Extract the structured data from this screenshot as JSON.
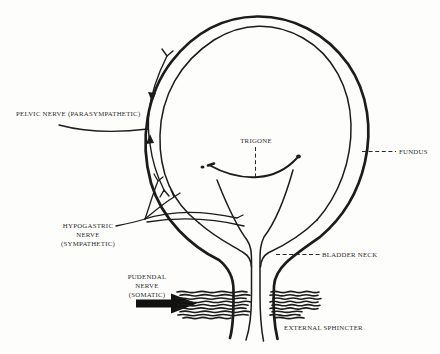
{
  "colors": {
    "ink": "#1c1c1c",
    "label_text": "#2d2d2d",
    "background": "#fdfdfc"
  },
  "labels": {
    "pelvic_nerve": "PELVIC NERVE (PARASYMPATHETIC)",
    "trigone": "TRIGONE",
    "fundus": "FUNDUS",
    "hypogastric_nerve": [
      "HYPOGASTRIC",
      "NERVE",
      "(SYMPATHETIC)"
    ],
    "bladder_neck": "BLADDER NECK",
    "pudendal_nerve": [
      "PUDENDAL",
      "NERVE",
      "(SOMATIC)"
    ],
    "external_sphincter": "EXTERNAL SPHINCTER"
  }
}
